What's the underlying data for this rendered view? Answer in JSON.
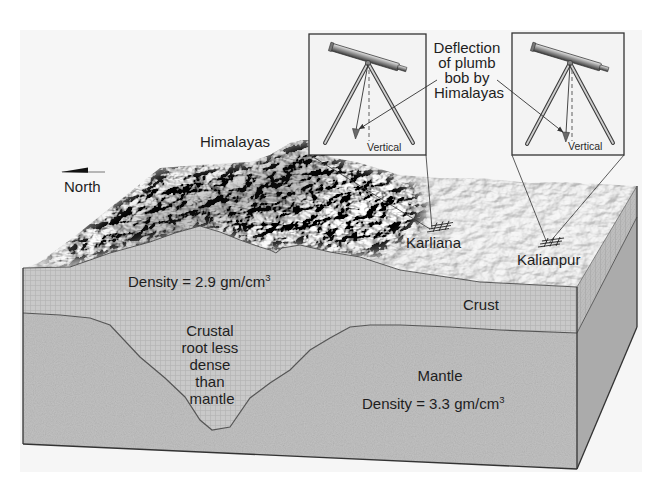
{
  "figure": {
    "labels": {
      "north": "North",
      "himalayas": "Himalayas",
      "deflection_note": [
        "Deflection",
        "of plumb",
        "bob by",
        "Himalayas"
      ],
      "vertical_left": "Vertical",
      "vertical_right": "Vertical",
      "karliana": "Karliana",
      "kalianpur": "Kalianpur",
      "crust_density": {
        "text": "Density = 2.9 gm/cm",
        "sup": "3"
      },
      "crust": "Crust",
      "crustal_root": [
        "Crustal",
        "root less",
        "dense",
        "than",
        "mantle"
      ],
      "mantle": "Mantle",
      "mantle_density": {
        "text": "Density = 3.3 gm/cm",
        "sup": "3"
      }
    },
    "insets": [
      {
        "station": "Karliana",
        "instrument": "telescope-with-plumb-bob",
        "deflection": "large"
      },
      {
        "station": "Kalianpur",
        "instrument": "telescope-with-plumb-bob",
        "deflection": "small"
      }
    ],
    "layers": [
      {
        "name": "Crust",
        "density_g_cm3": 2.9
      },
      {
        "name": "Mantle",
        "density_g_cm3": 3.3
      }
    ]
  },
  "colors": {
    "background_panel": "#f6f6f6",
    "inset_fill": "#f3f3f3",
    "crust": "#c9c9c9",
    "mantle": "#bababa",
    "side_crust": "#bdbdbd",
    "side_mantle": "#ababab",
    "outline": "#333333",
    "text": "#1e1e1e"
  }
}
